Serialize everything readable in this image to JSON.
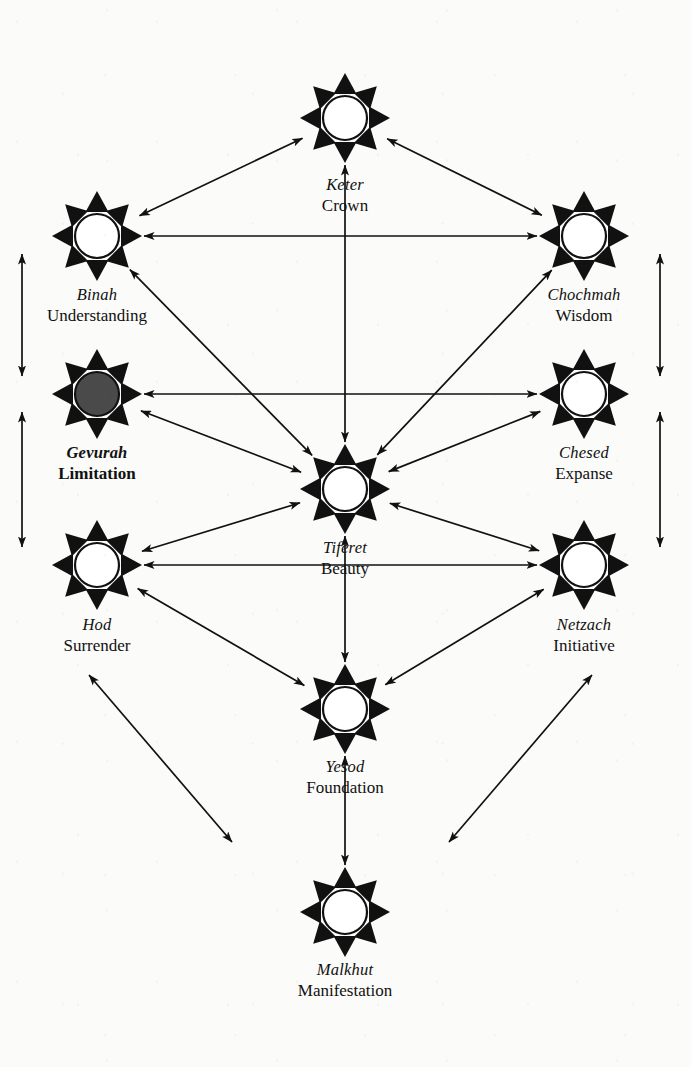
{
  "figure": {
    "background_color": "#fbfbf9",
    "ink_color": "#111111",
    "filled_node_color": "#4a4a4a"
  },
  "chart_data": {
    "type": "diagram",
    "nodes": [
      {
        "id": "keter",
        "hebrew": "Keter",
        "english": "Crown",
        "x": 345,
        "y": 118,
        "filled": false,
        "bold": false,
        "label_y": 190
      },
      {
        "id": "binah",
        "hebrew": "Binah",
        "english": "Understanding",
        "x": 97,
        "y": 236,
        "filled": false,
        "bold": false,
        "label_y": 300
      },
      {
        "id": "chochmah",
        "hebrew": "Chochmah",
        "english": "Wisdom",
        "x": 584,
        "y": 236,
        "filled": false,
        "bold": false,
        "label_y": 300
      },
      {
        "id": "gevurah",
        "hebrew": "Gevurah",
        "english": "Limitation",
        "x": 97,
        "y": 394,
        "filled": true,
        "bold": true,
        "label_y": 458
      },
      {
        "id": "chesed",
        "hebrew": "Chesed",
        "english": "Expanse",
        "x": 584,
        "y": 394,
        "filled": false,
        "bold": false,
        "label_y": 458
      },
      {
        "id": "tiferet",
        "hebrew": "Tiferet",
        "english": "Beauty",
        "x": 345,
        "y": 489,
        "filled": false,
        "bold": false,
        "label_y": 553
      },
      {
        "id": "hod",
        "hebrew": "Hod",
        "english": "Surrender",
        "x": 97,
        "y": 565,
        "filled": false,
        "bold": false,
        "label_y": 630
      },
      {
        "id": "netzach",
        "hebrew": "Netzach",
        "english": "Initiative",
        "x": 584,
        "y": 565,
        "filled": false,
        "bold": false,
        "label_y": 630
      },
      {
        "id": "yesod",
        "hebrew": "Yesod",
        "english": "Foundation",
        "x": 345,
        "y": 709,
        "filled": false,
        "bold": false,
        "label_y": 772
      },
      {
        "id": "malkhut",
        "hebrew": "Malkhut",
        "english": "Manifestation",
        "x": 345,
        "y": 912,
        "filled": false,
        "bold": false,
        "label_y": 975
      }
    ],
    "edges": [
      {
        "from": "binah",
        "to": "keter",
        "style": "double-headed"
      },
      {
        "from": "chochmah",
        "to": "keter",
        "style": "double-headed"
      },
      {
        "from": "binah",
        "to": "chochmah",
        "style": "double-headed"
      },
      {
        "from": "keter",
        "to": "tiferet",
        "style": "double-headed"
      },
      {
        "from": "binah",
        "to": "tiferet",
        "style": "double-headed"
      },
      {
        "from": "chochmah",
        "to": "tiferet",
        "style": "double-headed"
      },
      {
        "from": "gevurah",
        "to": "chesed",
        "style": "double-headed"
      },
      {
        "from": "gevurah",
        "to": "tiferet",
        "style": "double-headed"
      },
      {
        "from": "chesed",
        "to": "tiferet",
        "style": "double-headed"
      },
      {
        "from": "hod",
        "to": "tiferet",
        "style": "double-headed"
      },
      {
        "from": "netzach",
        "to": "tiferet",
        "style": "double-headed"
      },
      {
        "from": "hod",
        "to": "netzach",
        "style": "double-headed"
      },
      {
        "from": "tiferet",
        "to": "yesod",
        "style": "double-headed"
      },
      {
        "from": "hod",
        "to": "yesod",
        "style": "double-headed"
      },
      {
        "from": "netzach",
        "to": "yesod",
        "style": "double-headed"
      },
      {
        "from": "yesod",
        "to": "malkhut",
        "style": "double-headed"
      },
      {
        "from": "binah",
        "to": "gevurah",
        "style": "double-headed-outer-left"
      },
      {
        "from": "gevurah",
        "to": "hod",
        "style": "double-headed-outer-left"
      },
      {
        "from": "chochmah",
        "to": "chesed",
        "style": "double-headed-outer-right"
      },
      {
        "from": "chesed",
        "to": "netzach",
        "style": "double-headed-outer-right"
      },
      {
        "from": "hod",
        "to": "outward-lower-left",
        "style": "double-headed-open"
      },
      {
        "from": "netzach",
        "to": "outward-lower-right",
        "style": "double-headed-open"
      }
    ],
    "legend": []
  }
}
